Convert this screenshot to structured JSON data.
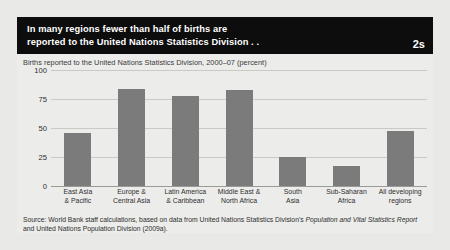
{
  "figure": {
    "number": "2s",
    "title_line_1": "In many regions fewer than half of births are",
    "title_line_2": "reported to the United Nations Statistics Division . ."
  },
  "source": {
    "prefix": "Source: World Bank staff calculations, based on data from United Nations Statistics Division's ",
    "italic_1": "Population and Vital Statistics Report",
    "middle": " and United Nations Population Division (2009a)."
  },
  "chart_data": {
    "type": "bar",
    "title": "Births reported to the United Nations Statistics Division, 2000–07 (percent)",
    "xlabel": "",
    "ylabel": "",
    "ylim": [
      0,
      100
    ],
    "yticks": [
      100,
      75,
      50,
      25,
      0
    ],
    "ytick_labels": [
      "100",
      "75",
      "50",
      "25",
      "0"
    ],
    "grid": true,
    "legend": "none",
    "bar_color": "#7b7b7b",
    "categories": [
      "East Asia\n& Pacific",
      "Europe &\nCentral Asia",
      "Latin America\n& Caribbean",
      "Middle East &\nNorth Africa",
      "South\nAsia",
      "Sub-Saharan\nAfrica",
      "All developing\nregions"
    ],
    "category_lines": [
      [
        "East Asia",
        "& Pacific"
      ],
      [
        "Europe &",
        "Central Asia"
      ],
      [
        "Latin America",
        "& Caribbean"
      ],
      [
        "Middle East &",
        "North Africa"
      ],
      [
        "South",
        "Asia"
      ],
      [
        "Sub-Saharan",
        "Africa"
      ],
      [
        "All developing",
        "regions"
      ]
    ],
    "values": [
      46,
      84,
      78,
      83,
      25,
      17,
      47
    ]
  }
}
